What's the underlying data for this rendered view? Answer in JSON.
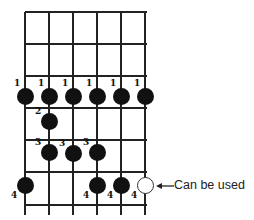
{
  "diagram": {
    "type": "guitar-fingering-chart",
    "strings": 6,
    "frets_shown": 6,
    "geometry": {
      "string_x": [
        25,
        49,
        73,
        97,
        121,
        145
      ],
      "fret_y": [
        12,
        44,
        76,
        108,
        140,
        172,
        205
      ]
    },
    "notes": [
      {
        "string": 1,
        "row": 1,
        "finger": "1",
        "filled": true,
        "x": 25,
        "y": 96
      },
      {
        "string": 2,
        "row": 1,
        "finger": "1",
        "filled": true,
        "x": 49,
        "y": 96
      },
      {
        "string": 3,
        "row": 1,
        "finger": "1",
        "filled": true,
        "x": 73,
        "y": 96
      },
      {
        "string": 4,
        "row": 1,
        "finger": "1",
        "filled": true,
        "x": 97,
        "y": 96
      },
      {
        "string": 5,
        "row": 1,
        "finger": "1",
        "filled": true,
        "x": 121,
        "y": 96
      },
      {
        "string": 6,
        "row": 1,
        "finger": "1",
        "filled": true,
        "x": 145,
        "y": 96
      },
      {
        "string": 2,
        "row": 2,
        "finger": "2",
        "filled": true,
        "x": 49,
        "y": 121
      },
      {
        "string": 2,
        "row": 3,
        "finger": "3",
        "filled": true,
        "x": 49,
        "y": 152
      },
      {
        "string": 3,
        "row": 3,
        "finger": "3",
        "filled": true,
        "x": 73,
        "y": 153
      },
      {
        "string": 4,
        "row": 3,
        "finger": "3",
        "filled": true,
        "x": 97,
        "y": 152
      },
      {
        "string": 1,
        "row": 4,
        "finger": "4",
        "filled": true,
        "x": 25,
        "y": 185
      },
      {
        "string": 4,
        "row": 4,
        "finger": "4",
        "filled": true,
        "x": 97,
        "y": 185
      },
      {
        "string": 5,
        "row": 4,
        "finger": "4",
        "filled": true,
        "x": 121,
        "y": 185
      },
      {
        "string": 6,
        "row": 4,
        "finger": "4",
        "filled": false,
        "x": 145,
        "y": 185
      }
    ],
    "annotation": {
      "label": "Can be used",
      "target": "open-circle string 6 row 4"
    },
    "colors": {
      "ink": "#111111",
      "background": "#ffffff"
    }
  }
}
